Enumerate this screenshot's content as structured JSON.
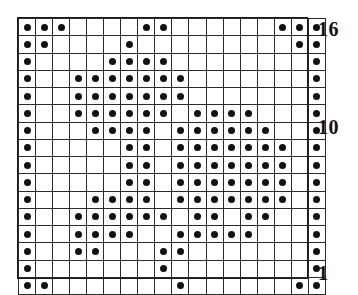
{
  "figure": {
    "name": "knitting-chart",
    "type": "grid-pattern-chart",
    "columns": 18,
    "rows": 16,
    "symbol": "filled-dot",
    "colors": {
      "grid_line": "#2b2b2b",
      "dot": "#111111",
      "background": "#ffffff",
      "label": "#121212"
    }
  },
  "row_labels": [
    {
      "id": "row-label-16",
      "text": "16",
      "row": 16
    },
    {
      "id": "row-label-10",
      "text": "10",
      "row": 10
    },
    {
      "id": "row-label-1",
      "text": "1",
      "row": 1
    }
  ],
  "chart_data": {
    "type": "heatmap",
    "title": "",
    "xlabel": "",
    "ylabel": "",
    "columns": 18,
    "rows": 16,
    "legend": "filled circle = stitch marked",
    "row_order": "top row is 16, bottom row is 1",
    "filled_cells_by_row": {
      "16": [
        1,
        2,
        3,
        8,
        9,
        16,
        17,
        18
      ],
      "15": [
        1,
        2,
        7,
        17,
        18
      ],
      "14": [
        1,
        6,
        7,
        8,
        9,
        18
      ],
      "13": [
        1,
        4,
        5,
        6,
        7,
        8,
        9,
        10,
        18
      ],
      "12": [
        1,
        4,
        5,
        6,
        7,
        8,
        9,
        10,
        18
      ],
      "11": [
        1,
        4,
        5,
        6,
        7,
        8,
        9,
        11,
        12,
        13,
        14,
        18
      ],
      "10": [
        1,
        5,
        6,
        7,
        8,
        10,
        11,
        12,
        13,
        14,
        15,
        18
      ],
      "9": [
        1,
        7,
        8,
        10,
        11,
        12,
        13,
        14,
        15,
        16,
        18
      ],
      "8": [
        1,
        7,
        8,
        10,
        11,
        12,
        13,
        14,
        15,
        16,
        18
      ],
      "7": [
        1,
        7,
        8,
        10,
        11,
        12,
        13,
        14,
        15,
        16,
        18
      ],
      "6": [
        1,
        5,
        6,
        7,
        8,
        10,
        11,
        12,
        13,
        14,
        15,
        16,
        18
      ],
      "5": [
        1,
        4,
        5,
        6,
        7,
        8,
        9,
        11,
        12,
        14,
        15,
        18
      ],
      "4": [
        1,
        4,
        5,
        6,
        7,
        10,
        11,
        12,
        13,
        14,
        18
      ],
      "3": [
        1,
        4,
        5,
        9,
        10,
        18
      ],
      "2": [
        1,
        9,
        18
      ],
      "1": [
        1,
        2,
        10,
        17,
        18
      ]
    },
    "grid": "on"
  }
}
